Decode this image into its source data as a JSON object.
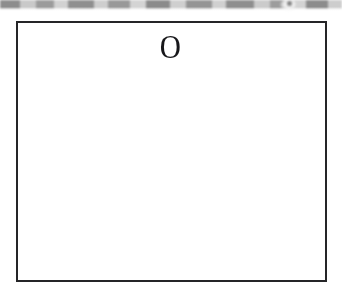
{
  "page": {
    "background_color": "#ffffff",
    "width": 342,
    "height": 297
  },
  "top_bar": {
    "name": "blurred-toolbar-strip",
    "description": "partially cropped blurred gray toolbar band at very top of screen",
    "height_px": 11,
    "blocks": [
      {
        "x": 0,
        "width": 20,
        "color": "#8d8d8d"
      },
      {
        "x": 20,
        "width": 16,
        "color": "#c9c9c9"
      },
      {
        "x": 36,
        "width": 18,
        "color": "#9b9b9b"
      },
      {
        "x": 54,
        "width": 14,
        "color": "#d2d2d2"
      },
      {
        "x": 68,
        "width": 26,
        "color": "#8f8f8f"
      },
      {
        "x": 94,
        "width": 14,
        "color": "#cecece"
      },
      {
        "x": 108,
        "width": 22,
        "color": "#999999"
      },
      {
        "x": 130,
        "width": 16,
        "color": "#d4d4d4"
      },
      {
        "x": 146,
        "width": 24,
        "color": "#8b8b8b"
      },
      {
        "x": 170,
        "width": 16,
        "color": "#cfcfcf"
      },
      {
        "x": 186,
        "width": 26,
        "color": "#949494"
      },
      {
        "x": 212,
        "width": 14,
        "color": "#d0d0d0"
      },
      {
        "x": 226,
        "width": 28,
        "color": "#8e8e8e"
      },
      {
        "x": 254,
        "width": 16,
        "color": "#cbcbcb"
      },
      {
        "x": 270,
        "width": 22,
        "color": "#9d9d9d"
      },
      {
        "x": 292,
        "width": 14,
        "color": "#d3d3d3"
      },
      {
        "x": 306,
        "width": 22,
        "color": "#8c8c8c"
      },
      {
        "x": 328,
        "width": 14,
        "color": "#cdcdcd"
      }
    ],
    "cursor": {
      "name": "cursor-highlight-blob",
      "x": 288,
      "y": 4,
      "color": "#f7f7f7"
    }
  },
  "canvas": {
    "name": "bordered-content-box",
    "border_color": "#252528",
    "border_width_px": 2,
    "fill_color": "#ffffff",
    "x": 16,
    "y": 21,
    "width": 311,
    "height": 261,
    "content": {
      "glyph": "O",
      "glyph_color": "#17171a",
      "glyph_center_x": 174,
      "glyph_center_y": 56
    }
  }
}
